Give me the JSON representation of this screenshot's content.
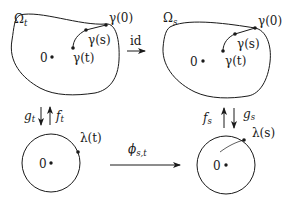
{
  "diagram": {
    "top_left": {
      "domain_label": "Ω",
      "domain_sub": "t",
      "origin_label": "0",
      "points": [
        {
          "label": "γ(0)"
        },
        {
          "label": "γ(s)"
        },
        {
          "label": "γ(t)"
        }
      ]
    },
    "top_right": {
      "domain_label": "Ω",
      "domain_sub": "s",
      "origin_label": "0",
      "points": [
        {
          "label": "γ(0)"
        },
        {
          "label": "γ(s)"
        },
        {
          "label": "γ(t)"
        }
      ]
    },
    "top_arrow": {
      "label": "id"
    },
    "left_maps": {
      "down": {
        "label": "g",
        "sub": "t"
      },
      "up": {
        "label": "f",
        "sub": "t"
      }
    },
    "right_maps": {
      "up": {
        "label": "f",
        "sub": "s"
      },
      "down": {
        "label": "g",
        "sub": "s"
      }
    },
    "bottom_left": {
      "origin_label": "0",
      "point_label": "λ(t)"
    },
    "bottom_right": {
      "origin_label": "0",
      "point_label": "λ(s)"
    },
    "bottom_arrow": {
      "label": "ϕ",
      "sub": "s,t"
    },
    "colors": {
      "stroke": "#1a1a1a",
      "background": "#ffffff"
    }
  }
}
